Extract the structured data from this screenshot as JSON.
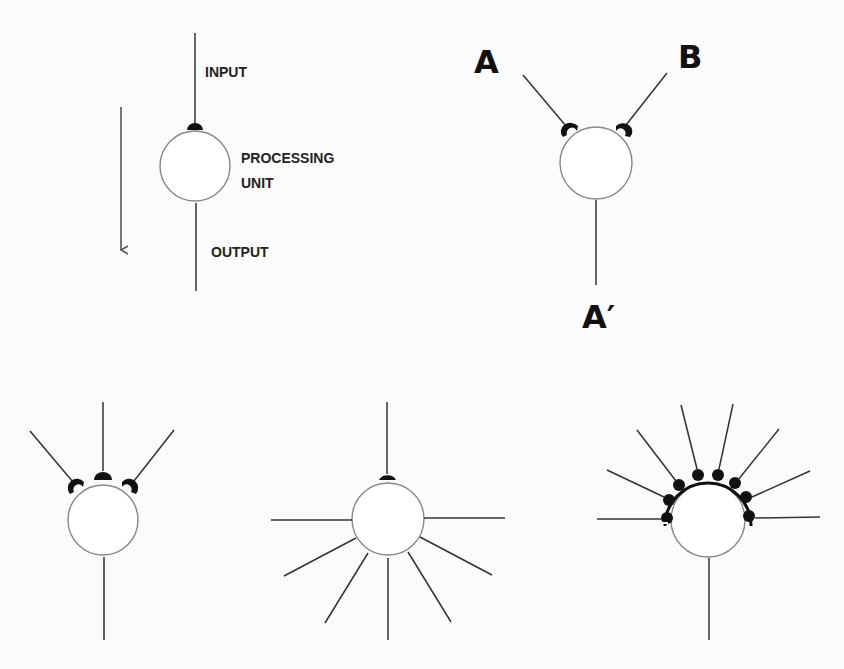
{
  "diagram": {
    "panel_single": {
      "labels": {
        "input": "INPUT",
        "processing_1": "PROCESSING",
        "processing_2": "UNIT",
        "output": "OUTPUT"
      },
      "flow_direction": "down"
    },
    "panel_two_inputs": {
      "labels": {
        "a": "A",
        "b": "B",
        "a_prime": "A′"
      }
    },
    "panel_convergence": {
      "inputs": 3,
      "outputs": 1
    },
    "panel_divergence": {
      "inputs": 1,
      "outputs": 7
    },
    "panel_high_convergence": {
      "inputs": 9,
      "outputs": 1
    },
    "colors": {
      "line": "#333333",
      "circle": "#888888",
      "synapse": "#111111",
      "background": "#fbfbfb"
    }
  }
}
